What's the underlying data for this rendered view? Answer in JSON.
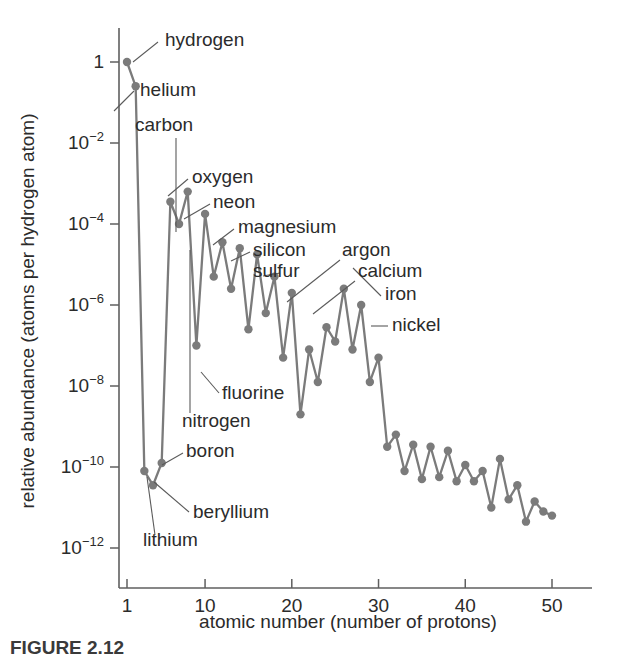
{
  "figure": {
    "caption": "FIGURE 2.12",
    "background_color": "#ffffff",
    "line_color": "#7b7b7b",
    "axis_color": "#5f5f5f",
    "text_color": "#2b2b2b"
  },
  "chart_data": {
    "type": "line",
    "title": "",
    "subtitle": "",
    "xlabel": "atomic number (number of protons)",
    "ylabel": "relative abundance (atoms per hydrogen atom)",
    "xlim": [
      0,
      55
    ],
    "ylim_log10": [
      -13,
      0.6
    ],
    "yscale": "log",
    "grid": false,
    "legend": "none",
    "xticks": [
      1,
      10,
      20,
      30,
      40,
      50
    ],
    "xticklabels": [
      "1",
      "10",
      "20",
      "30",
      "40",
      "50"
    ],
    "yticks_log10": [
      0,
      -2,
      -4,
      -6,
      -8,
      -10,
      -12
    ],
    "yticklabels": [
      "1",
      "10⁻²",
      "10⁻⁴",
      "10⁻⁶",
      "10⁻⁸",
      "10⁻¹⁰",
      "10⁻¹²"
    ],
    "ytick_bases": [
      "1",
      "10",
      "10",
      "10",
      "10",
      "10",
      "10"
    ],
    "ytick_exponents": [
      "",
      "-2",
      "-4",
      "-6",
      "-8",
      "-10",
      "-12"
    ],
    "x": [
      1,
      2,
      3,
      4,
      5,
      6,
      7,
      8,
      9,
      10,
      11,
      12,
      13,
      14,
      15,
      16,
      17,
      18,
      19,
      20,
      21,
      22,
      23,
      24,
      25,
      26,
      27,
      28,
      29,
      30,
      31,
      32,
      33,
      34,
      35,
      36,
      37,
      38,
      39,
      40,
      41,
      42,
      43,
      44,
      45,
      46,
      47,
      48,
      49,
      50
    ],
    "y_log10": [
      0,
      -0.6,
      -10.1,
      -10.45,
      -9.9,
      -3.45,
      -4.0,
      -3.2,
      -7.0,
      -3.75,
      -5.3,
      -4.45,
      -5.6,
      -4.6,
      -6.6,
      -4.75,
      -6.2,
      -5.3,
      -7.3,
      -5.7,
      -8.7,
      -7.1,
      -7.9,
      -6.55,
      -6.9,
      -5.6,
      -7.1,
      -6.0,
      -7.9,
      -7.3,
      -9.5,
      -9.2,
      -10.1,
      -9.45,
      -10.3,
      -9.5,
      -10.25,
      -9.6,
      -10.35,
      -9.95,
      -10.35,
      -10.1,
      -11.0,
      -9.8,
      -10.8,
      -10.45,
      -11.35,
      -10.85,
      -11.1,
      -11.2
    ],
    "annotations": [
      {
        "label": "hydrogen",
        "element_z": 1,
        "text_x": 165,
        "text_y": 46,
        "leader": [
          [
            158,
            42
          ],
          [
            133,
            62
          ]
        ]
      },
      {
        "label": "helium",
        "element_z": 2,
        "text_x": 140,
        "text_y": 96,
        "leader": [
          [
            134,
            91
          ],
          [
            114,
            111
          ]
        ]
      },
      {
        "label": "carbon",
        "element_z": 6,
        "text_x": 135,
        "text_y": 131,
        "leader": [
          [
            176,
            138
          ],
          [
            176,
            232
          ]
        ]
      },
      {
        "label": "oxygen",
        "element_z": 8,
        "text_x": 192,
        "text_y": 183,
        "leader": [
          [
            188,
            179
          ],
          [
            168,
            196
          ]
        ]
      },
      {
        "label": "neon",
        "element_z": 10,
        "text_x": 213,
        "text_y": 208,
        "leader": [
          [
            210,
            204
          ],
          [
            184,
            219
          ]
        ]
      },
      {
        "label": "magnesium",
        "element_z": 12,
        "text_x": 238,
        "text_y": 233,
        "leader": [
          [
            234,
            229
          ],
          [
            213,
            245
          ]
        ]
      },
      {
        "label": "silicon",
        "element_z": 14,
        "text_x": 253,
        "text_y": 256,
        "leader": [
          [
            250,
            252
          ],
          [
            231,
            261
          ]
        ]
      },
      {
        "label": "sulfur",
        "element_z": 16,
        "text_x": 253,
        "text_y": 277,
        "leader": [
          [
            280,
            273
          ],
          [
            263,
            276
          ]
        ]
      },
      {
        "label": "argon",
        "element_z": 18,
        "text_x": 342,
        "text_y": 256,
        "leader": [
          [
            340,
            260
          ],
          [
            287,
            302
          ]
        ]
      },
      {
        "label": "calcium",
        "element_z": 20,
        "text_x": 358,
        "text_y": 277,
        "leader": [
          [
            355,
            281
          ],
          [
            313,
            314
          ]
        ]
      },
      {
        "label": "iron",
        "element_z": 26,
        "text_x": 385,
        "text_y": 300,
        "leader": [
          [
            381,
            296
          ],
          [
            353,
            268
          ]
        ]
      },
      {
        "label": "nickel",
        "element_z": 28,
        "text_x": 392,
        "text_y": 331,
        "leader": [
          [
            388,
            326
          ],
          [
            371,
            326
          ]
        ]
      },
      {
        "label": "fluorine",
        "element_z": 9,
        "text_x": 222,
        "text_y": 399,
        "leader": [
          [
            219,
            393
          ],
          [
            201,
            372
          ]
        ]
      },
      {
        "label": "nitrogen",
        "element_z": 7,
        "text_x": 182,
        "text_y": 427,
        "leader": [
          [
            190,
            413
          ],
          [
            190,
            250
          ]
        ]
      },
      {
        "label": "boron",
        "element_z": 5,
        "text_x": 186,
        "text_y": 457,
        "leader": [
          [
            183,
            453
          ],
          [
            162,
            465
          ]
        ]
      },
      {
        "label": "beryllium",
        "element_z": 4,
        "text_x": 193,
        "text_y": 518,
        "leader": [
          [
            189,
            512
          ],
          [
            154,
            482
          ]
        ]
      },
      {
        "label": "lithium",
        "element_z": 3,
        "text_x": 143,
        "text_y": 546,
        "leader": [
          [
            155,
            535
          ],
          [
            147,
            477
          ]
        ]
      }
    ]
  }
}
